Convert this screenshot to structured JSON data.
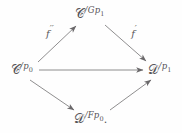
{
  "figure": {
    "kind": "commutative-diagram",
    "background_color": "#fefefe",
    "ink_color": "#555356",
    "trailing_punctuation": "."
  },
  "nodes": [
    {
      "id": "c-over-p0",
      "name": "object-c-over-p0",
      "base": "Ċ",
      "script_letter": "C",
      "superscript": "/p",
      "subscript": "0",
      "full_text": "C̲/p₀",
      "x": 22,
      "y": 70
    },
    {
      "id": "c-over-gp1",
      "name": "object-c-over-gp1",
      "base": "Ċ",
      "script_letter": "C",
      "superscript": "/Gp",
      "subscript": "1",
      "full_text": "C/Gp₁",
      "x": 90,
      "y": 14
    },
    {
      "id": "d-over-p1",
      "name": "object-d-over-p1",
      "base": "D",
      "script_letter": "D",
      "superscript": "/p",
      "subscript": "1",
      "full_text": "D/p₁",
      "x": 160,
      "y": 70
    },
    {
      "id": "d-over-fp0",
      "name": "object-d-over-fp0",
      "base": "D",
      "script_letter": "D",
      "superscript": "/Fp",
      "subscript": "0",
      "full_text": "D/Fp₀",
      "x": 91,
      "y": 119
    }
  ],
  "edges": [
    {
      "id": "edge-f-double-prime",
      "name": "arrow-c-p0-to-c-gp1",
      "from": "c-over-p0",
      "to": "c-over-gp1",
      "label": "f",
      "label_primes": "′′",
      "label_x": 50,
      "label_y": 33,
      "x1": 38,
      "y1": 62,
      "x2": 76,
      "y2": 26
    },
    {
      "id": "edge-f-prime",
      "name": "arrow-c-gp1-to-d-p1",
      "from": "c-over-gp1",
      "to": "d-over-p1",
      "label": "f",
      "label_primes": "′",
      "label_x": 134,
      "label_y": 33,
      "x1": 105,
      "y1": 25,
      "x2": 146,
      "y2": 61
    },
    {
      "id": "edge-horizontal",
      "name": "arrow-c-p0-to-d-p1",
      "from": "c-over-p0",
      "to": "d-over-p1",
      "label": "",
      "label_primes": "",
      "x1": 39,
      "y1": 70,
      "x2": 143,
      "y2": 70
    },
    {
      "id": "edge-down-left",
      "name": "arrow-c-p0-to-d-fp0",
      "from": "c-over-p0",
      "to": "d-over-fp0",
      "label": "",
      "label_primes": "",
      "x1": 30,
      "y1": 80,
      "x2": 74,
      "y2": 110
    },
    {
      "id": "edge-up-right",
      "name": "arrow-d-fp0-to-d-p1",
      "from": "d-over-fp0",
      "to": "d-over-p1",
      "label": "",
      "label_primes": "",
      "x1": 110,
      "y1": 110,
      "x2": 151,
      "y2": 80
    }
  ]
}
